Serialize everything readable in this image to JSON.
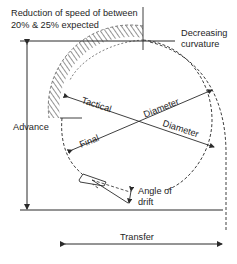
{
  "diagram": {
    "type": "ship-turning-circle",
    "labels": {
      "speed_reduction_line1": "Reduction of speed of between",
      "speed_reduction_line2": "20% & 25% expected",
      "decreasing_curvature_line1": "Decreasing",
      "decreasing_curvature_line2": "curvature",
      "advance": "Advance",
      "tactical": "Tactical",
      "diameter_upper": "Diameter",
      "final": "Final",
      "diameter_lower": "Diameter",
      "angle_of_drift_line1": "Angle of",
      "angle_of_drift_line2": "drift",
      "transfer": "Transfer"
    },
    "colors": {
      "line": "#2a2a2a",
      "background": "#ffffff"
    }
  }
}
